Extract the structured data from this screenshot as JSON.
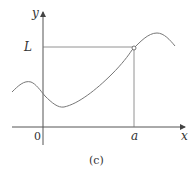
{
  "diagram": {
    "caption": "(c)",
    "axes": {
      "x_label": "x",
      "y_label": "y",
      "origin_label": "0"
    },
    "markers": {
      "x_tick_label": "a",
      "y_tick_label": "L"
    },
    "point": {
      "description": "open circle at (a, L)",
      "filled": false
    },
    "colors": {
      "axis": "#555555",
      "curve": "#777777",
      "guide": "#777777",
      "text": "#333333"
    }
  }
}
